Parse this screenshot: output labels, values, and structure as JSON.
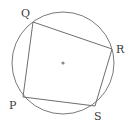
{
  "diagram": {
    "type": "cyclic-quadrilateral",
    "circle": {
      "cx": 63,
      "cy": 63,
      "r": 51
    },
    "center_dot": {
      "x": 63,
      "y": 63
    },
    "vertices": [
      {
        "label": "Q",
        "x": 33,
        "y": 22,
        "lx": 21,
        "ly": 17
      },
      {
        "label": "R",
        "x": 112,
        "y": 49,
        "lx": 116,
        "ly": 53
      },
      {
        "label": "S",
        "x": 95,
        "y": 106,
        "lx": 94,
        "ly": 120
      },
      {
        "label": "P",
        "x": 23,
        "y": 97,
        "lx": 9,
        "ly": 109
      }
    ],
    "colors": {
      "stroke": "#7a7a7a",
      "center": "#8a8a8a",
      "label": "#3a3a3a"
    }
  }
}
